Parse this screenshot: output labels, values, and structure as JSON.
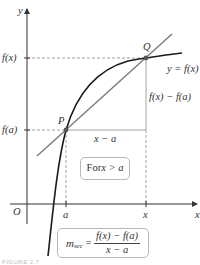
{
  "diagram": {
    "axes": {
      "x_label": "x",
      "y_label": "y",
      "origin_label": "O"
    },
    "points": [
      {
        "label": "P",
        "x_symbol": "a",
        "y_symbol": "f(a)"
      },
      {
        "label": "Q",
        "x_symbol": "x",
        "y_symbol": "f(x)"
      }
    ],
    "y_ticks": [
      "f(x)",
      "f(a)"
    ],
    "x_ticks": [
      "a",
      "x"
    ],
    "curve_label": "y = f(x)",
    "rise_label": "f(x) − f(a)",
    "run_label": "x − a",
    "condition_box": {
      "prefix": "For ",
      "expr": "x > a"
    },
    "formula_box": {
      "lhs": "m",
      "lhs_sub": "sec",
      "equals": " = ",
      "numerator": "f(x) − f(a)",
      "denominator": "x − a"
    },
    "caption": "FIGURE 2.7",
    "colors": {
      "curve": "#1a1a1a",
      "secant": "#7a7a7a",
      "axes": "#333333",
      "dashed": "#888888",
      "box_border": "#b8b8b8"
    }
  }
}
